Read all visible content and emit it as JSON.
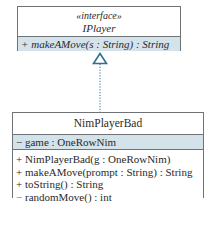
{
  "interface": {
    "stereotype": "«interface»",
    "name": "IPlayer",
    "methods": [
      {
        "visibility": "+",
        "signature": "makeAMove(s : String) : String"
      }
    ]
  },
  "relationship": {
    "type": "realization",
    "style": "dotted-line-hollow-triangle",
    "from": "NimPlayerBad",
    "to": "IPlayer"
  },
  "class": {
    "name": "NimPlayerBad",
    "attributes": [
      {
        "visibility": "−",
        "signature": "game : OneRowNim"
      }
    ],
    "methods": [
      {
        "visibility": "+",
        "signature": "NimPlayerBad(g : OneRowNim)"
      },
      {
        "visibility": "+",
        "signature": "makeAMove(prompt : String) : String"
      },
      {
        "visibility": "+",
        "signature": "toString() : String"
      },
      {
        "visibility": "−",
        "signature": "randomMove() : int"
      }
    ]
  },
  "colors": {
    "border": "#6f7276",
    "highlight_fill": "#d4e2ea",
    "arrow": "#2f6f95",
    "private_marker": "#d03a3a",
    "text": "#2a2a2a"
  }
}
